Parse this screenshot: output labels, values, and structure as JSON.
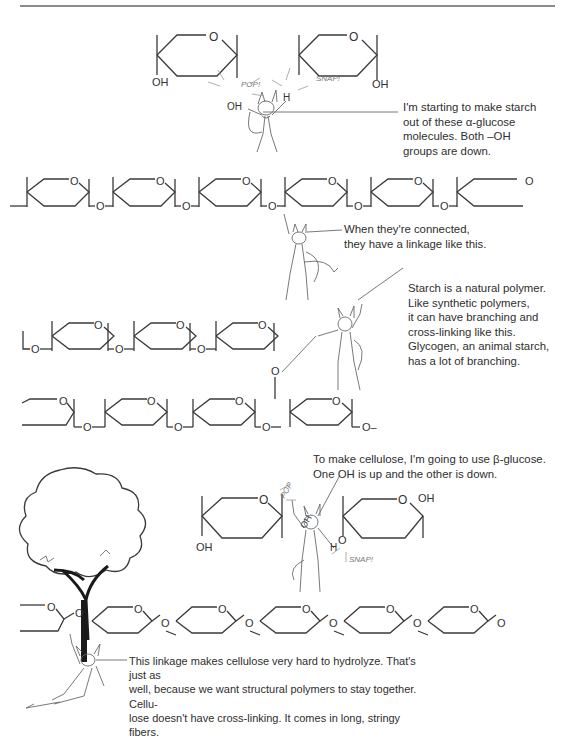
{
  "page": {
    "type": "textbook cartoon illustration",
    "topic": "starch and cellulose polymers"
  },
  "panels": [
    {
      "id": "alpha-glucose",
      "sound_effects": [
        "POP!",
        "SNAP!"
      ],
      "labels": {
        "oh_left": "OH",
        "oh_pop": "OH",
        "h": "H",
        "o": "O"
      },
      "caption": [
        "I'm starting to make starch",
        "out of these α-glucose",
        "molecules. Both –OH",
        "groups are down."
      ]
    },
    {
      "id": "alpha-linkage-chain",
      "ring_oxygen": "O",
      "bridge_oxygen": "O",
      "caption": [
        "When they're connected,",
        "they have a linkage like this."
      ]
    },
    {
      "id": "branching",
      "caption": [
        "Starch is a natural polymer.",
        "Like synthetic polymers,",
        "it can have branching and",
        "cross-linking like this.",
        "Glycogen, an animal starch,",
        "has a lot of branching."
      ],
      "chain_end": "O–"
    },
    {
      "id": "beta-glucose",
      "sound_effects": [
        "POP",
        "SNAP!"
      ],
      "labels": {
        "oh_left": "OH",
        "oh_right": "OH",
        "oh_pop": "OH",
        "h": "H",
        "o": "O"
      },
      "caption": [
        "To make cellulose, I'm going to use β-glucose.",
        "One OH is up and the other is down."
      ]
    },
    {
      "id": "cellulose-chain",
      "ring_oxygen": "O",
      "bridge_oxygen": "O",
      "caption": [
        "This linkage makes cellulose very hard to hydrolyze. That's just as",
        "well, because we want structural polymers to stay together. Cellu-",
        "lose doesn't have cross-linking. It comes in long, stringy fibers."
      ]
    }
  ],
  "icons": [
    "devil-character-icon",
    "tree-icon",
    "glucose-ring-icon"
  ],
  "colors": {
    "ink": "#3a3a3a",
    "rule": "#8a8a8a",
    "background": "#ffffff"
  }
}
